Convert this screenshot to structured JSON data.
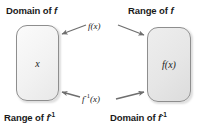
{
  "diagram": {
    "background_color": "#ffffff",
    "stroke_color": "#6e6e6e",
    "labels": {
      "top_left": {
        "text_prefix": "Domain of ",
        "symbol": "f",
        "superscript": ""
      },
      "top_right": {
        "text_prefix": "Range of ",
        "symbol": "f",
        "superscript": ""
      },
      "bottom_left": {
        "text_prefix": "Range of ",
        "symbol": "f",
        "superscript": "-1"
      },
      "bottom_right": {
        "text_prefix": "Domain of ",
        "symbol": "f",
        "superscript": "-1"
      }
    },
    "boxes": [
      {
        "id": "domain-box",
        "content": "x",
        "fill": "#f2f2f2",
        "border": "#8e8e8e"
      },
      {
        "id": "range-box",
        "content": "f(x)",
        "fill": "#e4e4e4",
        "border": "#8e8e8e"
      }
    ],
    "arrows": [
      {
        "id": "forward-arrow",
        "label_prefix": "f",
        "label_superscript": "",
        "label_suffix": "(x)",
        "direction": "left-to-right",
        "description": "top arrow from domain box to range box"
      },
      {
        "id": "inverse-arrow",
        "label_prefix": "f",
        "label_superscript": "-1",
        "label_suffix": "(x)",
        "direction": "right-to-left",
        "description": "bottom arrow from range box to domain box"
      }
    ]
  }
}
